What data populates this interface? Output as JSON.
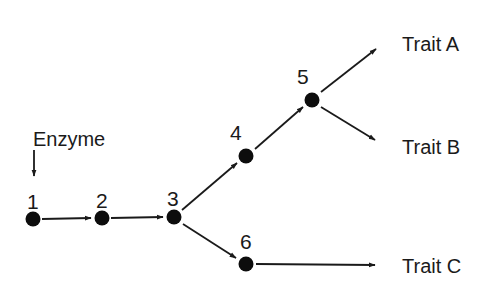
{
  "diagram": {
    "type": "pathway",
    "colors": {
      "ink": "#1a1a1a",
      "node": "#0d0d0d",
      "background": "#ffffff"
    },
    "enzyme": {
      "label": "Enzyme",
      "x": 33,
      "y": 146,
      "arrow": {
        "x": 34,
        "y1": 150,
        "y2": 176
      }
    },
    "nodes": [
      {
        "id": "1",
        "label": "1",
        "x": 33,
        "y": 219,
        "label_x": 27,
        "label_y": 209
      },
      {
        "id": "2",
        "label": "2",
        "x": 102,
        "y": 218,
        "label_x": 96,
        "label_y": 208
      },
      {
        "id": "3",
        "label": "3",
        "x": 174,
        "y": 217,
        "label_x": 168,
        "label_y": 206
      },
      {
        "id": "4",
        "label": "4",
        "x": 246,
        "y": 156,
        "label_x": 230,
        "label_y": 140
      },
      {
        "id": "5",
        "label": "5",
        "x": 312,
        "y": 100,
        "label_x": 297,
        "label_y": 84
      },
      {
        "id": "6",
        "label": "6",
        "x": 246,
        "y": 264,
        "label_x": 241,
        "label_y": 249
      }
    ],
    "traits": [
      {
        "id": "A",
        "label": "Trait A",
        "x": 402,
        "y": 51
      },
      {
        "id": "B",
        "label": "Trait B",
        "x": 402,
        "y": 154
      },
      {
        "id": "C",
        "label": "Trait C",
        "x": 402,
        "y": 273
      }
    ],
    "edges": [
      {
        "from": "1",
        "to": "2",
        "x1": 42,
        "y1": 219,
        "x2": 91,
        "y2": 218
      },
      {
        "from": "2",
        "to": "3",
        "x1": 111,
        "y1": 218,
        "x2": 163,
        "y2": 217
      },
      {
        "from": "3",
        "to": "4",
        "x1": 182,
        "y1": 210,
        "x2": 237,
        "y2": 163
      },
      {
        "from": "4",
        "to": "5",
        "x1": 255,
        "y1": 149,
        "x2": 303,
        "y2": 107
      },
      {
        "from": "5",
        "to": "Trait A",
        "x1": 321,
        "y1": 92,
        "x2": 376,
        "y2": 49
      },
      {
        "from": "5",
        "to": "Trait B",
        "x1": 321,
        "y1": 107,
        "x2": 375,
        "y2": 140
      },
      {
        "from": "3",
        "to": "6",
        "x1": 183,
        "y1": 224,
        "x2": 236,
        "y2": 258
      },
      {
        "from": "6",
        "to": "Trait C",
        "x1": 256,
        "y1": 264,
        "x2": 375,
        "y2": 265
      }
    ]
  }
}
